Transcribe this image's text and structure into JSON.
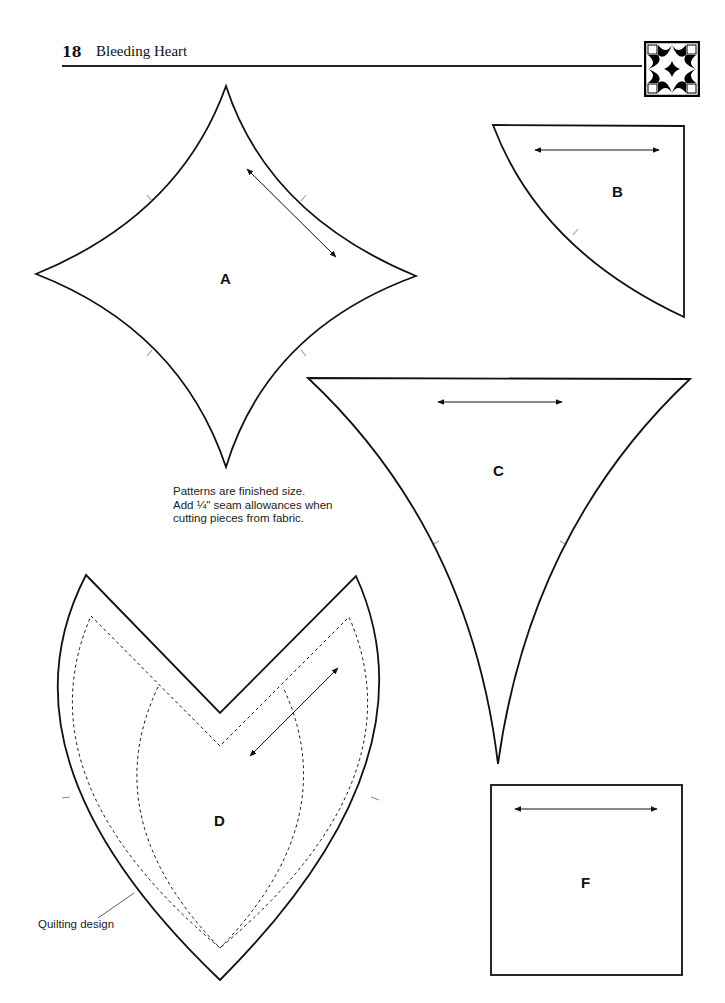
{
  "header": {
    "page_number": "18",
    "title": "Bleeding Heart",
    "block_icon": "bleeding-heart-quilt-block-icon"
  },
  "note": {
    "line1": "Patterns are finished size.",
    "line2": "Add ¼\" seam allowances when",
    "line3": "cutting pieces from fabric."
  },
  "pieces": {
    "A": "A",
    "B": "B",
    "C": "C",
    "D": "D",
    "F": "F"
  },
  "annotations": {
    "quilting_design": "Quilting design"
  },
  "colors": {
    "ink": "#111111",
    "paper": "#ffffff"
  }
}
